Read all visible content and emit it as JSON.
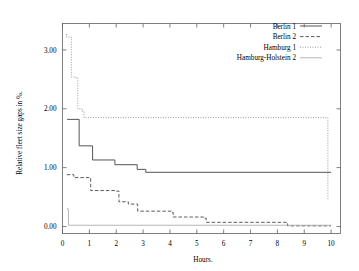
{
  "chart_data": {
    "type": "line",
    "subtype": "step",
    "title": "",
    "xlabel": "Hours.",
    "ylabel": "Relative fleet size gaps in %.",
    "xlim": [
      0,
      10.35
    ],
    "ylim": [
      -0.12,
      3.45
    ],
    "xticks": [
      0,
      1,
      2,
      3,
      4,
      5,
      6,
      7,
      8,
      9,
      10
    ],
    "xticklabels": [
      "0",
      "1",
      "2",
      "3",
      "4",
      "5",
      "6",
      "7",
      "8",
      "9",
      "10"
    ],
    "yticks": [
      0.0,
      1.0,
      2.0,
      3.0
    ],
    "yticklabels": [
      "0.00",
      "1.00",
      "2.00",
      "3.00"
    ],
    "grid": false,
    "legend_position": "top-right",
    "frame_color": "#606060",
    "series": [
      {
        "name": "Berlin 1",
        "style": "solid",
        "color": "#555555",
        "points": [
          [
            0.17,
            1.82
          ],
          [
            0.62,
            1.82
          ],
          [
            0.62,
            1.37
          ],
          [
            1.12,
            1.37
          ],
          [
            1.12,
            1.13
          ],
          [
            1.95,
            1.13
          ],
          [
            1.95,
            1.05
          ],
          [
            2.78,
            1.05
          ],
          [
            2.78,
            0.97
          ],
          [
            3.1,
            0.97
          ],
          [
            3.1,
            0.92
          ],
          [
            10.0,
            0.92
          ]
        ]
      },
      {
        "name": "Berlin 2",
        "style": "dashed",
        "color": "#4a4a4a",
        "points": [
          [
            0.16,
            0.88
          ],
          [
            0.42,
            0.88
          ],
          [
            0.42,
            0.83
          ],
          [
            1.05,
            0.83
          ],
          [
            1.05,
            0.61
          ],
          [
            2.0,
            0.61
          ],
          [
            2.0,
            0.6
          ],
          [
            2.1,
            0.6
          ],
          [
            2.1,
            0.42
          ],
          [
            2.45,
            0.42
          ],
          [
            2.45,
            0.38
          ],
          [
            2.8,
            0.38
          ],
          [
            2.8,
            0.26
          ],
          [
            4.05,
            0.26
          ],
          [
            4.05,
            0.24
          ],
          [
            4.12,
            0.24
          ],
          [
            4.12,
            0.16
          ],
          [
            5.25,
            0.16
          ],
          [
            5.25,
            0.14
          ],
          [
            5.35,
            0.14
          ],
          [
            5.35,
            0.07
          ],
          [
            8.38,
            0.07
          ],
          [
            8.38,
            0.01
          ],
          [
            10.0,
            0.01
          ]
        ]
      },
      {
        "name": "Hamburg 1",
        "style": "dotted",
        "color": "#8a8a8a",
        "points": [
          [
            0.15,
            3.27
          ],
          [
            0.15,
            3.22
          ],
          [
            0.33,
            3.22
          ],
          [
            0.33,
            2.54
          ],
          [
            0.5,
            2.54
          ],
          [
            0.5,
            2.52
          ],
          [
            0.57,
            2.52
          ],
          [
            0.57,
            2.0
          ],
          [
            0.72,
            2.0
          ],
          [
            0.72,
            1.96
          ],
          [
            0.8,
            1.96
          ],
          [
            0.8,
            1.85
          ],
          [
            9.88,
            1.85
          ],
          [
            9.88,
            0.46
          ],
          [
            9.9,
            0.46
          ]
        ]
      },
      {
        "name": "Hamburg-Holstein 2",
        "style": "solid-light",
        "color": "#a8a8a8",
        "points": [
          [
            0.16,
            0.3
          ],
          [
            0.22,
            0.3
          ],
          [
            0.22,
            0.02
          ],
          [
            10.0,
            0.02
          ]
        ]
      }
    ]
  },
  "legend": {
    "entries": [
      {
        "label": "Berlin 1",
        "style": "solid",
        "color": "#555555"
      },
      {
        "label": "Berlin 2",
        "style": "dashed",
        "color": "#4a4a4a"
      },
      {
        "label": "Hamburg 1",
        "style": "dotted",
        "color": "#8a8a8a"
      },
      {
        "label": "Hamburg-Holstein 2",
        "style": "solid-light",
        "color": "#a8a8a8"
      }
    ]
  }
}
